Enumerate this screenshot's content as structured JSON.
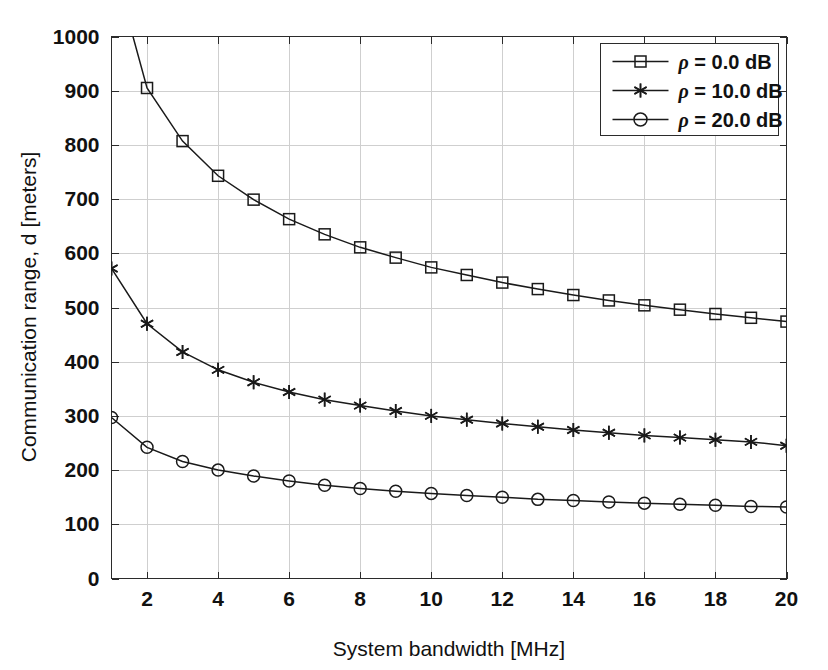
{
  "chart_data": {
    "type": "line",
    "title": "",
    "xlabel": "System bandwidth [MHz]",
    "ylabel": "Communication range, d [meters]",
    "xlim": [
      1,
      20
    ],
    "ylim": [
      0,
      1000
    ],
    "xticks": [
      2,
      4,
      6,
      8,
      10,
      12,
      14,
      16,
      18,
      20
    ],
    "xticklabels": [
      "2",
      "4",
      "6",
      "8",
      "10",
      "12",
      "14",
      "16",
      "18",
      "20"
    ],
    "yticks": [
      0,
      100,
      200,
      300,
      400,
      500,
      600,
      700,
      800,
      900,
      1000
    ],
    "yticklabels": [
      "0",
      "100",
      "200",
      "300",
      "400",
      "500",
      "600",
      "700",
      "800",
      "900",
      "1000"
    ],
    "grid": true,
    "legend_position": "upper right",
    "x": [
      1,
      2,
      3,
      4,
      5,
      6,
      7,
      8,
      9,
      10,
      11,
      12,
      13,
      14,
      15,
      16,
      17,
      18,
      19,
      20
    ],
    "series": [
      {
        "name": "ρ = 0.0 dB",
        "marker": "square",
        "values": [
          1145,
          905,
          807,
          743,
          699,
          663,
          635,
          611,
          592,
          574,
          560,
          546,
          534,
          523,
          513,
          504,
          496,
          488,
          481,
          474
        ]
      },
      {
        "name": "ρ = 10.0 dB",
        "marker": "star",
        "values": [
          572,
          470,
          418,
          385,
          362,
          344,
          330,
          319,
          309,
          300,
          293,
          286,
          280,
          274,
          269,
          264,
          260,
          256,
          252,
          245
        ]
      },
      {
        "name": "ρ = 20.0 dB",
        "marker": "circle",
        "values": [
          297,
          242,
          216,
          200,
          189,
          180,
          172,
          166,
          161,
          157,
          153,
          150,
          146,
          144,
          141,
          139,
          137,
          135,
          133,
          132
        ]
      }
    ]
  },
  "legend": {
    "items": [
      {
        "label": "ρ = 0.0 dB",
        "symbol": "ρ",
        "rest": " = 0.0 dB",
        "marker": "square"
      },
      {
        "label": "ρ = 10.0 dB",
        "symbol": "ρ",
        "rest": " = 10.0 dB",
        "marker": "star"
      },
      {
        "label": "ρ = 20.0 dB",
        "symbol": "ρ",
        "rest": " = 20.0 dB",
        "marker": "circle"
      }
    ]
  },
  "colors": {
    "background": "#ffffff",
    "line": "#1a1a1a",
    "grid": "#cfcfcf",
    "axis": "#2b2b2b",
    "text": "#111111"
  }
}
